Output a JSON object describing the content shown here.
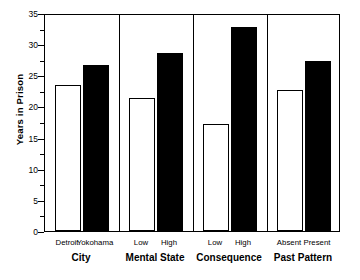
{
  "chart_data": {
    "type": "bar",
    "title": "",
    "xlabel": "",
    "ylabel": "Years in Prison",
    "ylim": [
      0,
      35
    ],
    "ytick_labels": [
      "0",
      "5",
      "10",
      "15",
      "20",
      "25",
      "30",
      "35"
    ],
    "ytick_values": [
      0,
      5,
      10,
      15,
      20,
      25,
      30,
      35
    ],
    "minor_tick_interval": 2.5,
    "grid": false,
    "legend": "none",
    "bar_styles": [
      "open",
      "filled"
    ],
    "groups": [
      {
        "label": "City",
        "categories": [
          "Detroit",
          "Yokohama"
        ],
        "values": [
          23.4,
          26.7
        ],
        "styles": [
          "open",
          "filled"
        ]
      },
      {
        "label": "Mental State",
        "categories": [
          "Low",
          "High"
        ],
        "values": [
          21.3,
          28.6
        ],
        "styles": [
          "open",
          "filled"
        ]
      },
      {
        "label": "Consequence",
        "categories": [
          "Low",
          "High"
        ],
        "values": [
          17.2,
          32.8
        ],
        "styles": [
          "open",
          "filled"
        ]
      },
      {
        "label": "Past Pattern",
        "categories": [
          "Absent",
          "Present"
        ],
        "values": [
          22.7,
          27.3
        ],
        "styles": [
          "open",
          "filled"
        ]
      }
    ],
    "categories": [
      "Detroit",
      "Yokohama",
      "Low",
      "High",
      "Low",
      "High",
      "Absent",
      "Present"
    ],
    "values": [
      23.4,
      26.7,
      21.3,
      28.6,
      17.2,
      32.8,
      22.7,
      27.3
    ],
    "colors": {
      "open_bar_fill": "#ffffff",
      "filled_bar_fill": "#000000",
      "axis": "#000000",
      "background": "#ffffff"
    }
  }
}
